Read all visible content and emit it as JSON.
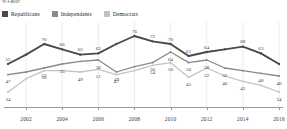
{
  "axis_note": "% Favor",
  "legend": {
    "items": [
      {
        "label": "Republicans",
        "color": "#4a4a4a"
      },
      {
        "label": "Independents",
        "color": "#8a8a8a"
      },
      {
        "label": "Democrats",
        "color": "#c3c3c3"
      }
    ]
  },
  "xaxis": {
    "ticks": [
      "2002",
      "2004",
      "2006",
      "2008",
      "2010",
      "2012",
      "2014",
      "2016"
    ]
  },
  "chart_data": {
    "type": "line",
    "title": "",
    "xlabel": "",
    "ylabel": "% Favor",
    "ylim": [
      28,
      82
    ],
    "grid": "vertical",
    "legend_position": "top-left",
    "x": [
      2001,
      2002,
      2003,
      2004,
      2005,
      2006,
      2007,
      2008,
      2009,
      2010,
      2011,
      2012,
      2013,
      2014,
      2015,
      2016
    ],
    "categories": [
      "2001",
      "2002",
      "2003",
      "2004",
      "2005",
      "2006",
      "2007",
      "2008",
      "2009",
      "2010",
      "2011",
      "2012",
      "2013",
      "2014",
      "2015",
      "2016"
    ],
    "series": [
      {
        "name": "Republicans",
        "color": "#4a4a4a",
        "values": [
          55,
          62,
          70,
          66,
          62,
          63,
          70,
          76,
          72,
          70,
          61,
          64,
          66,
          68,
          63,
          55
        ],
        "labels": [
          "55",
          "",
          "70",
          "66",
          "62",
          "63",
          "",
          "76",
          "72",
          "70",
          "61",
          "64",
          "",
          "68",
          "63",
          ""
        ]
      },
      {
        "name": "Independents",
        "color": "#8a8a8a",
        "values": [
          47,
          49,
          52,
          55,
          57,
          58,
          49,
          53,
          56,
          64,
          56,
          58,
          52,
          50,
          48,
          46
        ],
        "labels": [
          "47",
          "",
          "52",
          "55",
          "",
          "58",
          "49",
          "",
          "56",
          "64",
          "56",
          "58",
          "52",
          "",
          "48",
          "46"
        ]
      },
      {
        "name": "Democrats",
        "color": "#c3c3c3",
        "values": [
          34,
          44,
          50,
          50,
          49,
          51,
          47,
          50,
          54,
          56,
          45,
          52,
          46,
          42,
          39,
          34
        ],
        "labels": [
          "34",
          "",
          "50",
          "",
          "49",
          "51",
          "47",
          "",
          "54",
          "50",
          "45",
          "52",
          "46",
          "42",
          "",
          "34"
        ]
      }
    ]
  }
}
